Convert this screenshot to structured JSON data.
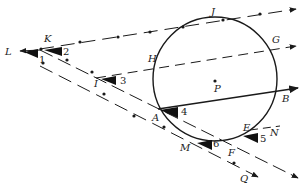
{
  "diagram": {
    "type": "geometry-circle-secants-tangents",
    "circle": {
      "center_label": "P",
      "cx": 215,
      "cy": 78,
      "r": 62
    },
    "points": {
      "L": [
        18,
        50
      ],
      "K": [
        38,
        48
      ],
      "J": [
        223,
        19
      ],
      "G": [
        270,
        46
      ],
      "H": [
        160,
        62
      ],
      "I": [
        88,
        79
      ],
      "P": [
        215,
        80
      ],
      "B": [
        285,
        96
      ],
      "A": [
        158,
        110
      ],
      "E": [
        245,
        125
      ],
      "N": [
        270,
        133
      ],
      "M": [
        195,
        145
      ],
      "F": [
        240,
        150
      ],
      "Q": [
        248,
        174
      ]
    },
    "labels": [
      {
        "id": "L",
        "text": "L",
        "x": 5,
        "y": 55
      },
      {
        "id": "K",
        "text": "K",
        "x": 44,
        "y": 42
      },
      {
        "id": "J",
        "text": "J",
        "x": 211,
        "y": 15
      },
      {
        "id": "G",
        "text": "G",
        "x": 272,
        "y": 43
      },
      {
        "id": "H",
        "text": "H",
        "x": 148,
        "y": 62
      },
      {
        "id": "I",
        "text": "I",
        "x": 94,
        "y": 87
      },
      {
        "id": "P",
        "text": "P",
        "x": 214,
        "y": 92
      },
      {
        "id": "B",
        "text": "B",
        "x": 282,
        "y": 102
      },
      {
        "id": "A",
        "text": "A",
        "x": 154,
        "y": 121
      },
      {
        "id": "E",
        "text": "E",
        "x": 245,
        "y": 131
      },
      {
        "id": "N",
        "text": "N",
        "x": 270,
        "y": 136
      },
      {
        "id": "M",
        "text": "M",
        "x": 178,
        "y": 151
      },
      {
        "id": "F",
        "text": "F",
        "x": 227,
        "y": 156
      },
      {
        "id": "Q",
        "text": "Q",
        "x": 238,
        "y": 181
      }
    ],
    "angles": [
      {
        "id": "1",
        "text": "1",
        "x": 40,
        "y": 62
      },
      {
        "id": "2",
        "text": "2",
        "x": 64,
        "y": 54
      },
      {
        "id": "3",
        "text": "3",
        "x": 121,
        "y": 85
      },
      {
        "id": "4",
        "text": "4",
        "x": 181,
        "y": 114
      },
      {
        "id": "5",
        "text": "5",
        "x": 262,
        "y": 141
      },
      {
        "id": "6",
        "text": "6",
        "x": 210,
        "y": 146
      }
    ],
    "stroke_color": "#1a1a1a"
  }
}
